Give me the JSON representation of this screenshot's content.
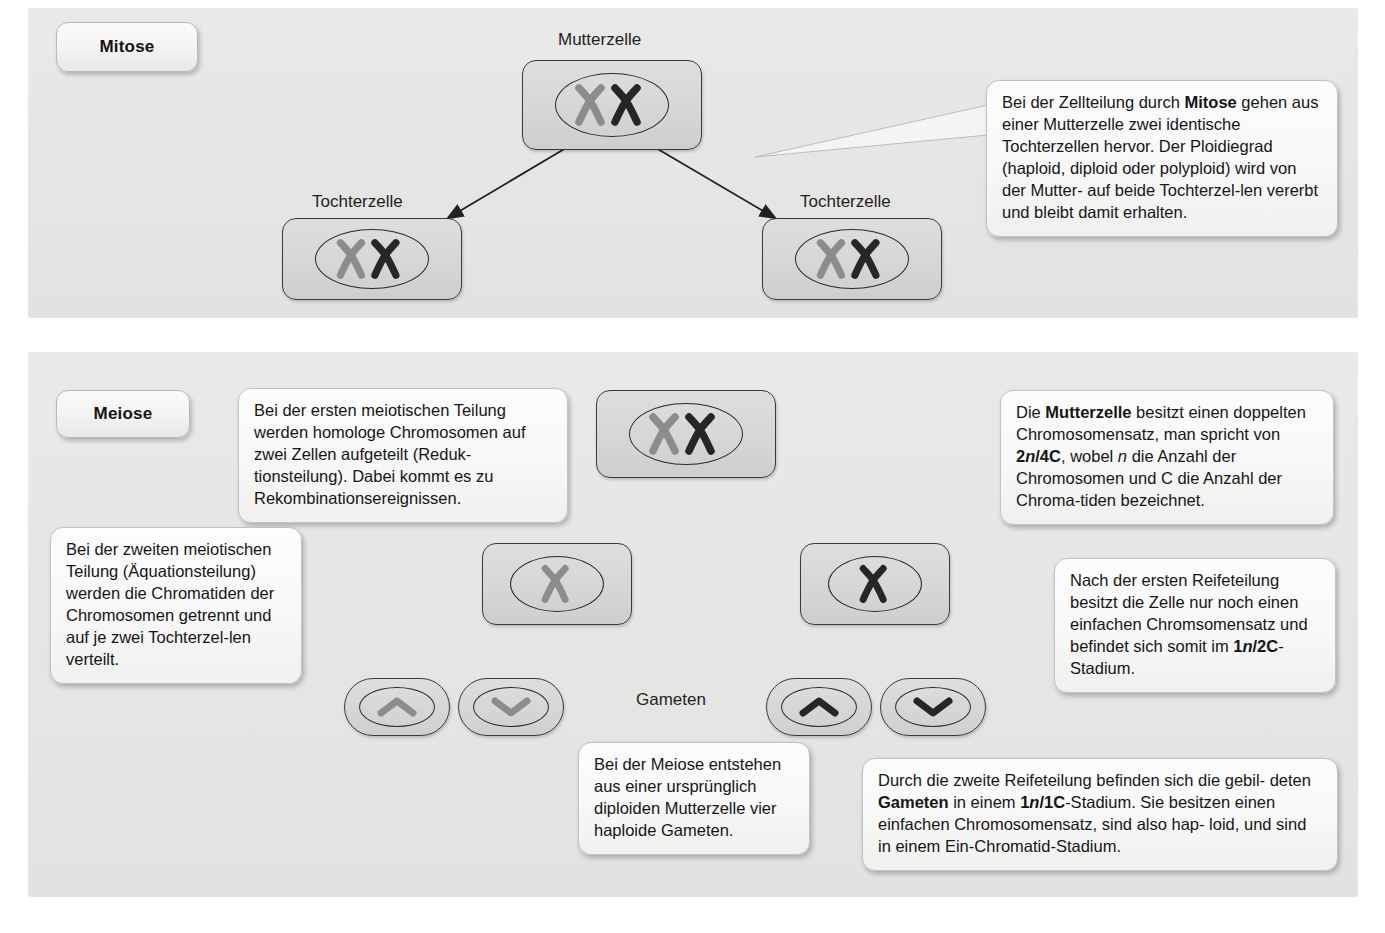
{
  "sections": [
    {
      "id": "mitose",
      "tag": "Mitose"
    },
    {
      "id": "meiose",
      "tag": "Meiose"
    }
  ],
  "labels": {
    "mutterzelle": "Mutterzelle",
    "tochterzelle_left": "Tochterzelle",
    "tochterzelle_right": "Tochterzelle",
    "gameten": "Gameten"
  },
  "callouts": {
    "mitose_main": {
      "parts": [
        {
          "text": "Bei der Zellteilung durch ",
          "style": "normal"
        },
        {
          "text": "Mitose",
          "style": "bold"
        },
        {
          "text": " gehen aus einer Mutterzelle zwei identische Tochterzellen hervor. Der Ploidiegrad (haploid, diploid oder polyploid) wird von der Mutter- auf beide Tochterzellen vererbt und bleibt damit erhalten.",
          "style": "normal"
        }
      ],
      "plain": "Bei der Zellteilung durch Mitose gehen aus einer Mutterzelle zwei identische Tochterzellen hervor. Der Ploidiegrad (haploid, diploid oder polyploid) wird von der Mutter- auf beide Tochterzellen vererbt und bleibt damit erhalten."
    },
    "meiose_first_division": {
      "plain": "Bei der ersten meiotischen Teilung werden homologe Chromosomen auf zwei Zellen aufgeteilt (Reduktionsteilung). Dabei kommt es zu Rekombinationsereignissen."
    },
    "meiose_mutterzelle": {
      "plain": "Die Mutterzelle besitzt einen doppelten Chromosomensatz, man spricht von 2n/4C, wobel n die Anzahl der Chromosomen und C die Anzahl der Chromatiden bezeichnet."
    },
    "meiose_second_division": {
      "plain": "Bei der zweiten meiotischen Teilung (Äquationsteilung) werden die Chromatiden der Chromosomen getrennt und auf je zwei Tochterzellen verteilt."
    },
    "meiose_after_first": {
      "plain": "Nach der ersten Reifeteilung besitzt die Zelle nur noch einen einfachen Chromsomensatz und befindet sich somit im 1n/2C-Stadium."
    },
    "meiose_four_gametes": {
      "plain": "Bei der Meiose entstehen aus einer ursprünglich diploiden Mutterzelle vier haploide Gameten."
    },
    "meiose_gameten_stage": {
      "plain": "Durch die zweite Reifeteilung befinden sich die gebildeten Gameten in einem 1n/1C-Stadium. Sie besitzen einen einfachen Chromosomensatz, sind also haploid, und sind in einem Ein-Chromatid-Stadium."
    }
  },
  "terms": {
    "mitose": "Mitose",
    "mutterzelle": "Mutterzelle",
    "gameten": "Gameten",
    "n": "n",
    "two_n_four_c_prefix": "2",
    "two_n_four_c_suffix": "/4C",
    "one_n_two_c_prefix": "1",
    "one_n_two_c_suffix": "/2C",
    "one_n_one_c_prefix": "1",
    "one_n_one_c_suffix": "/1C"
  },
  "fragments": {
    "m1_a": "Bei der Zellteilung durch ",
    "m1_b": " gehen",
    "m1_c": "aus einer Mutterzelle zwei identische",
    "m1_d": "Tochterzellen hervor. Der Ploidiegrad",
    "m1_e": "(haploid, diploid oder polyploid) wird",
    "m1_f": "von der Mutter- auf beide Tochterzel-",
    "m1_g": "len vererbt und bleibt damit erhalten.",
    "f1_a": "Bei der ersten meiotischen Teilung",
    "f1_b": "werden homologe Chromosomen",
    "f1_c": "auf zwei Zellen aufgeteilt (Reduk-",
    "f1_d": "tionsteilung). Dabei kommt es zu",
    "f1_e": "Rekombinationsereignissen.",
    "mz_a": "Die ",
    "mz_b": " besitzt einen",
    "mz_c": "doppelten Chromosomensatz,",
    "mz_d": "man spricht von ",
    "mz_e": ", wobel ",
    "mz_f": "die Anzahl der Chromosomen",
    "mz_g": "und C die Anzahl der Chroma-",
    "mz_h": "tiden bezeichnet.",
    "sd_a": "Bei der zweiten meiotischen",
    "sd_b": "Teilung (Äquationsteilung)",
    "sd_c": "werden die Chromatiden",
    "sd_d": "der Chromosomen getrennt",
    "sd_e": "und auf je zwei Tochterzel-",
    "sd_f": "len verteilt.",
    "af_a": "Nach der ersten Reifeteilung",
    "af_b": "besitzt die Zelle nur noch einen",
    "af_c": "einfachen Chromsomensatz",
    "af_d": "und befindet sich somit im",
    "af_e": "-Stadium.",
    "fg_a": "Bei der Meiose entstehen",
    "fg_b": "aus einer ursprünglich",
    "fg_c": "diploiden Mutterzelle vier",
    "fg_d": "haploide Gameten.",
    "gs_a": "Durch die zweite Reifeteilung befinden sich die gebil-",
    "gs_b": "deten ",
    "gs_c": " in einem ",
    "gs_d": "-Stadium. Sie besitzen",
    "gs_e": "einen einfachen Chromosomensatz, sind also hap-",
    "gs_f": "loid, und sind in einem Ein-Chromatid-Stadium."
  },
  "colors": {
    "panel_bg": "#e6e6e4",
    "cell_fill": "#d6d6d4",
    "cell_stroke": "#3a3a3a",
    "chromosome_gray": "#8c8c8c",
    "chromosome_dark": "#262626",
    "callout_bg": "#f8f8f6",
    "text": "#151515"
  },
  "diagram": {
    "type": "biology-process-diagram",
    "mitose_flow": [
      "Mutterzelle (2 chromosomes)",
      "Tochterzelle (2 chromosomes)",
      "Tochterzelle (2 chromosomes)"
    ],
    "meiose_flow": [
      "Mutterzelle (2 chromosomes)",
      "2 cells (1 chromosome each)",
      "4 gametes (1 chromatid each)"
    ]
  }
}
